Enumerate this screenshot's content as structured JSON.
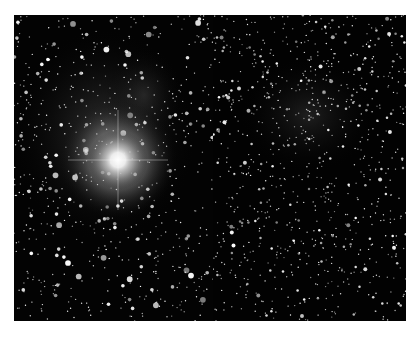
{
  "figure": {
    "panels": [
      {
        "id": "left",
        "content": "star field with bright saturated star and nebulosity",
        "bright_star": {
          "x": 104,
          "y": 145,
          "radius": 38
        }
      },
      {
        "id": "right",
        "content": "same star field with bright star removed, faint nebulosity"
      }
    ],
    "colors": {
      "background": "#000000",
      "stars": "#ffffff",
      "nebula": "#3a3a3a",
      "page": "#ffffff"
    }
  }
}
